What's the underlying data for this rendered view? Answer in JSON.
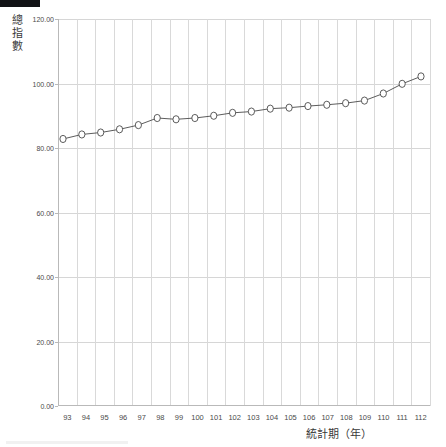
{
  "chart_data": {
    "type": "line",
    "title": "",
    "xlabel": "統計期（年）",
    "ylabel": "總指數",
    "categories": [
      "93",
      "94",
      "95",
      "96",
      "97",
      "98",
      "99",
      "100",
      "101",
      "102",
      "103",
      "104",
      "105",
      "106",
      "107",
      "108",
      "109",
      "110",
      "111",
      "112"
    ],
    "values": [
      82.8,
      84.2,
      84.8,
      85.8,
      87.1,
      89.3,
      88.9,
      89.3,
      90.0,
      90.9,
      91.3,
      92.2,
      92.5,
      93.0,
      93.4,
      93.9,
      94.7,
      96.9,
      99.9,
      102.2
    ],
    "ylim": [
      0.0,
      120.0
    ],
    "ytick_labels": [
      "0.00",
      "20.00",
      "40.00",
      "60.00",
      "80.00",
      "100.00",
      "120.00"
    ],
    "ytick_values": [
      0,
      20,
      40,
      60,
      80,
      100,
      120
    ],
    "grid": true,
    "legend": "none",
    "series_name": "總指數",
    "marker": "circle-open",
    "line_color": "#4a4a4a",
    "marker_fill": "#ffffff",
    "marker_stroke": "#4a4a4a",
    "grid_color": "#d6d6d6",
    "axis_color": "#b9b9b9"
  }
}
